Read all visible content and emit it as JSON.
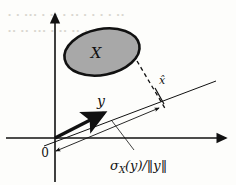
{
  "figure": {
    "kind": "support-function-diagram",
    "background_color": "#fdfdfb",
    "ink_color": "#111111",
    "set_fill_color": "#a8a8a8",
    "set_stroke_color": "#111111",
    "bleed_color": "#d9d6cf"
  },
  "labels": {
    "set_label": "X",
    "vector_label": "y",
    "support_point_label": "x̂",
    "origin_label": "0",
    "distance_label": "σ",
    "distance_subscript": "X",
    "distance_rest": "(y)/‖y‖"
  },
  "artifacts": {
    "bleed_line_1": "• •  •••  •  •• •  ••  •   • • • ••",
    "bleed_line_2": "•• ••  ••• •  ••  •• • •  •••"
  },
  "geometry": {
    "origin": {
      "x": 55,
      "y": 138
    },
    "vertical_axis_top": {
      "x": 55,
      "y": 14
    },
    "vertical_axis_bottom": {
      "x": 55,
      "y": 182
    },
    "horizontal_axis_left": {
      "x": 6,
      "y": 138
    },
    "horizontal_axis_right": {
      "x": 226,
      "y": 138
    },
    "tangent_line_start": {
      "x": 44,
      "y": 146
    },
    "tangent_line_end": {
      "x": 216,
      "y": 81
    },
    "vector_arrow_start": {
      "x": 55,
      "y": 138
    },
    "vector_arrow_end": {
      "x": 104,
      "y": 113
    },
    "support_point": {
      "x": 160,
      "y": 97
    },
    "dashed_start": {
      "x": 137,
      "y": 61
    },
    "dashed_end": {
      "x": 166,
      "y": 110
    },
    "measure_arrow_start": {
      "x": 56,
      "y": 151
    },
    "measure_arrow_end": {
      "x": 159,
      "y": 108
    },
    "leader_start": {
      "x": 134,
      "y": 152
    },
    "leader_end": {
      "x": 112,
      "y": 121
    },
    "ellipse_center": {
      "x": 102,
      "y": 52
    },
    "ellipse_rx": 38,
    "ellipse_ry": 23,
    "ellipse_rotation": -11
  }
}
